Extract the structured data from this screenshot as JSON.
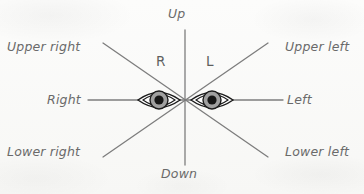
{
  "figure": {
    "kind": "gaze-direction-diagram",
    "background_color": "#fbfbfa",
    "line_color": "#7a7a7a",
    "label_color": "#6a6a6a",
    "eye_outline_color": "#1a1a1a",
    "iris_color": "#9b9b9b",
    "pupil_color": "#1a1a1a"
  },
  "center": {
    "x": 185,
    "y": 100
  },
  "eyes": [
    {
      "tag": "R",
      "side": "right",
      "center": {
        "x": 159,
        "y": 100
      },
      "width": 42,
      "height": 21,
      "iris_radius": 9,
      "pupil_radius": 4.5
    },
    {
      "tag": "L",
      "side": "left",
      "center": {
        "x": 212,
        "y": 100
      },
      "width": 42,
      "height": 21,
      "iris_radius": 9,
      "pupil_radius": 4.5
    }
  ],
  "axes": [
    {
      "name": "vertical",
      "x1": 185,
      "y1": 30,
      "x2": 185,
      "y2": 165
    },
    {
      "name": "horizontal",
      "x1": 88,
      "y1": 100,
      "x2": 283,
      "y2": 100
    },
    {
      "name": "diagonal-upper-right-to-lower-left",
      "x1": 103,
      "y1": 43,
      "x2": 268,
      "y2": 157
    },
    {
      "name": "diagonal-upper-left-to-lower-right",
      "x1": 268,
      "y1": 43,
      "x2": 103,
      "y2": 157
    }
  ],
  "labels": {
    "up": "Up",
    "down": "Down",
    "right": "Right",
    "left": "Left",
    "upper_right": "Upper right",
    "upper_left": "Upper left",
    "lower_right": "Lower right",
    "lower_left": "Lower left",
    "eye_right_tag": "R",
    "eye_left_tag": "L"
  }
}
